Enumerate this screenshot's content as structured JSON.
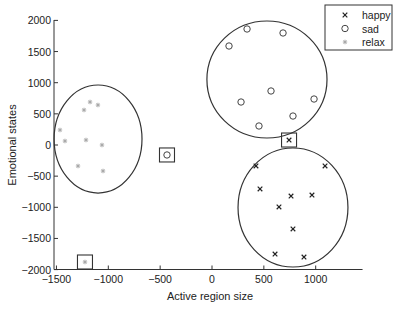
{
  "chart_data": {
    "type": "scatter",
    "title": "",
    "xlabel": "Active region size",
    "ylabel": "Emotional states",
    "xlim": [
      -1500,
      1500
    ],
    "ylim": [
      -2000,
      2000
    ],
    "xticks": [
      -1500,
      -1000,
      -500,
      0,
      500,
      1000
    ],
    "yticks": [
      2000,
      1500,
      1000,
      500,
      0,
      -500,
      -1000,
      -1500,
      -2000
    ],
    "xtick_labels": [
      "−1500",
      "−1000",
      "−500",
      "0",
      "500",
      "1000"
    ],
    "ytick_labels": [
      "2000",
      "1500",
      "1000",
      "500",
      "0",
      "−500",
      "−1000",
      "−1500",
      "−2000"
    ],
    "grid": false,
    "legend_position": "upper right",
    "series": [
      {
        "name": "happy",
        "marker": "x",
        "color": "#222222",
        "points": [
          [
            424,
            -337
          ],
          [
            1090,
            -337
          ],
          [
            463,
            -706
          ],
          [
            762,
            -819
          ],
          [
            964,
            -803
          ],
          [
            646,
            -995
          ],
          [
            781,
            -1348
          ],
          [
            608,
            -1750
          ],
          [
            887,
            -1798
          ]
        ],
        "outlier": [
          743,
          80
        ]
      },
      {
        "name": "sad",
        "marker": "o",
        "color": "#444444",
        "points": [
          [
            338,
            1862
          ],
          [
            685,
            1798
          ],
          [
            164,
            1589
          ],
          [
            569,
            867
          ],
          [
            280,
            690
          ],
          [
            984,
            738
          ],
          [
            781,
            465
          ],
          [
            453,
            305
          ]
        ],
        "outlier": [
          -434,
          -160
        ]
      },
      {
        "name": "relax",
        "marker": "*",
        "color": "#aaaaaa",
        "points": [
          [
            -1176,
            690
          ],
          [
            -1100,
            642
          ],
          [
            -1234,
            562
          ],
          [
            -1466,
            241
          ],
          [
            -1418,
            64
          ],
          [
            -1215,
            80
          ],
          [
            -1061,
            0
          ],
          [
            -1292,
            -337
          ],
          [
            -1051,
            -417
          ]
        ],
        "outlier": [
          -1225,
          -1878
        ]
      }
    ],
    "annotations": {
      "cluster_ellipses": [
        {
          "series": "relax",
          "cx": -1099,
          "cy": 96,
          "rx": 424,
          "ry": 867
        },
        {
          "series": "sad",
          "cx": 530,
          "cy": 1051,
          "rx": 579,
          "ry": 939
        },
        {
          "series": "happy",
          "cx": 781,
          "cy": -1003,
          "rx": 530,
          "ry": 955
        }
      ],
      "outlier_boxes": "Each series has one outlier point enclosed by a small square"
    }
  }
}
